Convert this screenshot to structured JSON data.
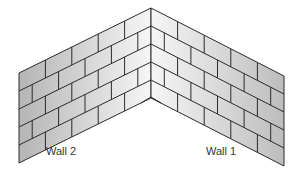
{
  "diagram": {
    "walls": [
      {
        "id": "wall2",
        "label": "Wall 2",
        "courses": 5
      },
      {
        "id": "wall1",
        "label": "Wall 1",
        "courses": 5
      }
    ],
    "colors": {
      "mortar": "#2b2b2b",
      "brick_dark": "#b9b9b9",
      "brick_light": "#f4f4f4"
    }
  }
}
